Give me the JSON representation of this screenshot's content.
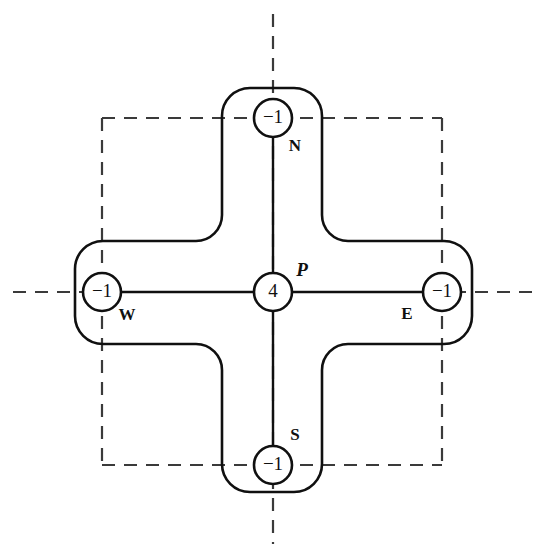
{
  "figure": {
    "canvas": {
      "width": 546,
      "height": 558
    },
    "background_color": "#ffffff",
    "stroke_color": "#101010",
    "grid_color": "#3a3a3a"
  },
  "chart_data": {
    "type": "diagram",
    "nodes": [
      {
        "id": "P",
        "label": "P",
        "value": "4",
        "cx": 273,
        "cy": 292,
        "r": 19,
        "label_dx": 29,
        "label_dy": -20,
        "label_style": "italic"
      },
      {
        "id": "N",
        "label": "N",
        "value": "−1",
        "cx": 273,
        "cy": 118,
        "r": 19,
        "label_dx": 22,
        "label_dy": 29,
        "label_style": "bold"
      },
      {
        "id": "W",
        "label": "W",
        "value": "−1",
        "cx": 102,
        "cy": 292,
        "r": 19,
        "label_dx": 25,
        "label_dy": 24,
        "label_style": "bold"
      },
      {
        "id": "E",
        "label": "E",
        "value": "−1",
        "cx": 442,
        "cy": 292,
        "r": 19,
        "label_dx": -35,
        "label_dy": 23,
        "label_style": "bold"
      },
      {
        "id": "S",
        "label": "S",
        "value": "−1",
        "cx": 273,
        "cy": 465,
        "r": 19,
        "label_dx": 22,
        "label_dy": -29,
        "label_style": "bold"
      }
    ],
    "edges": [
      {
        "from": "P",
        "to": "N"
      },
      {
        "from": "P",
        "to": "W"
      },
      {
        "from": "P",
        "to": "E"
      },
      {
        "from": "P",
        "to": "S"
      }
    ],
    "grid_lines": [
      {
        "orientation": "vertical",
        "at": 102,
        "from": 118,
        "to": 465
      },
      {
        "orientation": "vertical",
        "at": 273,
        "from": 14,
        "to": 544
      },
      {
        "orientation": "vertical",
        "at": 442,
        "from": 118,
        "to": 465
      },
      {
        "orientation": "horizontal",
        "at": 118,
        "from": 102,
        "to": 442
      },
      {
        "orientation": "horizontal",
        "at": 292,
        "from": 13,
        "to": 533
      },
      {
        "orientation": "horizontal",
        "at": 465,
        "from": 102,
        "to": 442
      }
    ],
    "outline": {
      "shape": "rounded-plus",
      "left": 75,
      "right": 472,
      "top": 88,
      "bottom": 492,
      "arm_left": 222,
      "arm_right": 322,
      "arm_top": 241,
      "arm_bottom": 344,
      "outer_radius": 28,
      "inner_radius": 26
    },
    "annotations": []
  }
}
